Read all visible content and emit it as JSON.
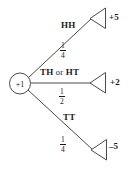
{
  "diagram": {
    "type": "probability-tree",
    "root": {
      "label": "+1",
      "shape": "circle"
    },
    "branches": [
      {
        "id": "hh",
        "outcome_label": "HH",
        "probability": "1/4",
        "probability_numerator": "1",
        "probability_denominator": "4",
        "payoff": "+5",
        "arrow": "triangle-left"
      },
      {
        "id": "th-or-ht",
        "outcome_label": "TH or HT",
        "outcome_first": "TH",
        "outcome_conjunction": "or",
        "outcome_second": "HT",
        "probability": "1/2",
        "probability_numerator": "1",
        "probability_denominator": "2",
        "payoff": "+2",
        "arrow": "triangle-left"
      },
      {
        "id": "tt",
        "outcome_label": "TT",
        "probability": "1/4",
        "probability_numerator": "1",
        "probability_denominator": "4",
        "payoff": "–5",
        "arrow": "triangle-left"
      }
    ],
    "colors": {
      "stroke": "#4a4a4a",
      "text": "#1a1a1a",
      "background": "#ffffff"
    }
  }
}
